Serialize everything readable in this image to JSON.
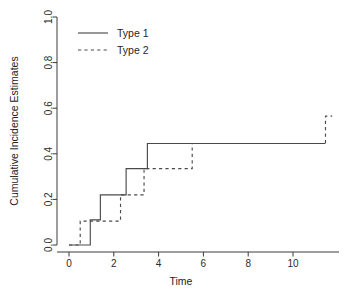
{
  "chart_data": {
    "type": "line",
    "subtype": "step",
    "title": "",
    "xlabel": "Time",
    "ylabel": "Cumulative Incidence Estimates",
    "xlim": [
      -0.35,
      11.9
    ],
    "ylim": [
      0.0,
      1.0
    ],
    "grid": false,
    "legend_position": "top-left",
    "x_ticks": [
      0,
      2,
      4,
      6,
      8,
      10
    ],
    "x_tick_labels": [
      "0",
      "2",
      "4",
      "6",
      "8",
      "10"
    ],
    "y_ticks": [
      0.0,
      0.2,
      0.4,
      0.6,
      0.8,
      1.0
    ],
    "y_tick_labels": [
      "0.0",
      "0.2",
      "0.4",
      "0.6",
      "0.8",
      "1.0"
    ],
    "series": [
      {
        "name": "Type 1",
        "style": "solid",
        "color": "#4a4a4a",
        "step_points": [
          {
            "x": 0.0,
            "y": 0.0
          },
          {
            "x": 0.95,
            "y": 0.0
          },
          {
            "x": 0.95,
            "y": 0.11
          },
          {
            "x": 1.4,
            "y": 0.11
          },
          {
            "x": 1.4,
            "y": 0.22
          },
          {
            "x": 2.55,
            "y": 0.22
          },
          {
            "x": 2.55,
            "y": 0.335
          },
          {
            "x": 3.5,
            "y": 0.335
          },
          {
            "x": 3.5,
            "y": 0.445
          },
          {
            "x": 11.45,
            "y": 0.445
          }
        ]
      },
      {
        "name": "Type 2",
        "style": "dashed",
        "color": "#4a4a4a",
        "step_points": [
          {
            "x": 0.0,
            "y": 0.0
          },
          {
            "x": 0.5,
            "y": 0.0
          },
          {
            "x": 0.5,
            "y": 0.105
          },
          {
            "x": 2.3,
            "y": 0.105
          },
          {
            "x": 2.3,
            "y": 0.22
          },
          {
            "x": 3.35,
            "y": 0.22
          },
          {
            "x": 3.35,
            "y": 0.335
          },
          {
            "x": 5.5,
            "y": 0.335
          },
          {
            "x": 5.5,
            "y": 0.445
          },
          {
            "x": 11.45,
            "y": 0.445
          },
          {
            "x": 11.45,
            "y": 0.565
          },
          {
            "x": 11.75,
            "y": 0.565
          }
        ]
      }
    ],
    "legend": [
      {
        "label": "Type 1",
        "style": "solid"
      },
      {
        "label": "Type 2",
        "style": "dashed"
      }
    ]
  }
}
